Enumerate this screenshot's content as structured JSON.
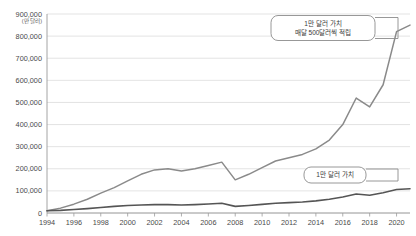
{
  "chart_data": {
    "type": "line",
    "title": "",
    "xlabel": "",
    "ylabel": "",
    "unit_label": "(만 달러)",
    "ylim": [
      0,
      900000
    ],
    "ytick_values": [
      0,
      100000,
      200000,
      300000,
      400000,
      500000,
      600000,
      700000,
      800000,
      900000
    ],
    "ytick_labels": [
      "0",
      "100,000",
      "200,000",
      "300,000",
      "400,000",
      "500,000",
      "600,000",
      "700,000",
      "800,000",
      "900,000"
    ],
    "xlim": [
      1994,
      2021
    ],
    "xtick_values": [
      1994,
      1996,
      1998,
      2000,
      2002,
      2004,
      2006,
      2008,
      2010,
      2012,
      2014,
      2016,
      2018,
      2020
    ],
    "xtick_labels": [
      "1994",
      "1996",
      "1998",
      "2000",
      "2002",
      "2004",
      "2006",
      "2008",
      "2010",
      "2012",
      "2014",
      "2016",
      "2018",
      "2020"
    ],
    "grid": true,
    "legend": "none",
    "x": [
      1994,
      1995,
      1996,
      1997,
      1998,
      1999,
      2000,
      2001,
      2002,
      2003,
      2004,
      2005,
      2006,
      2007,
      2008,
      2009,
      2010,
      2011,
      2012,
      2013,
      2014,
      2015,
      2016,
      2017,
      2018,
      2019,
      2020,
      2021
    ],
    "series": [
      {
        "name": "매달 500달러씩 적립",
        "color": "#8a8a8a",
        "width": 1.5,
        "values": [
          10000,
          22000,
          40000,
          62000,
          90000,
          115000,
          145000,
          175000,
          195000,
          200000,
          190000,
          200000,
          215000,
          230000,
          150000,
          175000,
          205000,
          235000,
          250000,
          265000,
          290000,
          330000,
          400000,
          520000,
          480000,
          580000,
          820000,
          850000
        ]
      },
      {
        "name": "1만 달러 가치",
        "color": "#555555",
        "width": 1.6,
        "values": [
          10000,
          12000,
          16000,
          20000,
          25000,
          30000,
          34000,
          36000,
          38000,
          38000,
          36000,
          38000,
          41000,
          44000,
          30000,
          34000,
          39000,
          44000,
          47000,
          50000,
          55000,
          62000,
          72000,
          86000,
          80000,
          92000,
          106000,
          110000
        ]
      }
    ],
    "annotations": [
      {
        "name": "callout-top",
        "lines": [
          "1만 달러 가치",
          "매달 500달러씩 적립"
        ],
        "target_x": 2021,
        "target_y": 850000
      },
      {
        "name": "callout-bottom",
        "lines": [
          "1만 달러 가치"
        ],
        "target_x": 2021,
        "target_y": 110000
      }
    ]
  }
}
